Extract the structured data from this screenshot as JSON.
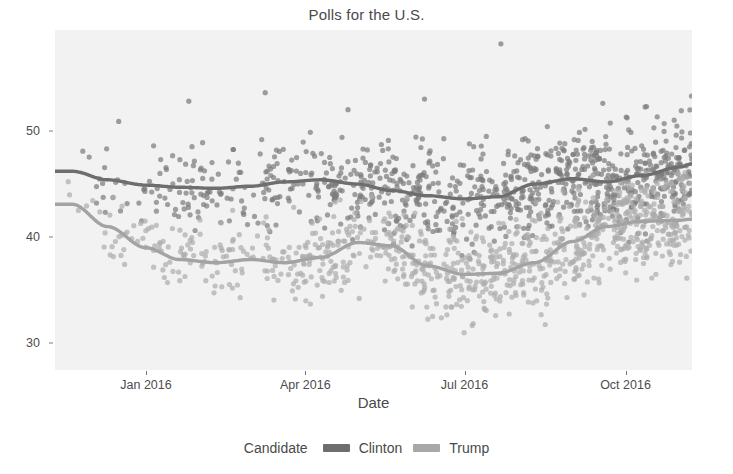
{
  "chart_data": {
    "type": "scatter",
    "title": "Polls for the U.S.",
    "xlabel": "Date",
    "ylabel": "",
    "grid": false,
    "legend_position": "bottom",
    "legend_title": "Candidate",
    "xlim": [
      "2015-11-10",
      "2016-11-08"
    ],
    "ylim": [
      27.5,
      59.5
    ],
    "yticks": [
      30,
      40,
      50
    ],
    "ytick_labels": [
      "30",
      "40",
      "50"
    ],
    "xticks": [
      "2016-01-01",
      "2016-04-01",
      "2016-07-01",
      "2016-10-01"
    ],
    "xtick_labels": [
      "Jan 2016",
      "Apr 2016",
      "Jul 2016",
      "Oct 2016"
    ],
    "colors": {
      "clinton_line": "#6e6e6e",
      "clinton_points": "#7d7d7d",
      "trump_line": "#a3a3a3",
      "trump_points": "#adadad",
      "panel_background": "#f2f2f2",
      "axis_text": "#4d4d4d"
    },
    "series": [
      {
        "name": "Clinton",
        "type": "smooth-trend",
        "trend_x": [
          "2015-11-20",
          "2015-12-10",
          "2016-01-01",
          "2016-01-20",
          "2016-02-10",
          "2016-03-01",
          "2016-03-20",
          "2016-04-10",
          "2016-05-01",
          "2016-05-20",
          "2016-06-10",
          "2016-07-01",
          "2016-07-20",
          "2016-08-10",
          "2016-09-01",
          "2016-09-20",
          "2016-10-10",
          "2016-11-01",
          "2016-11-08"
        ],
        "trend_y": [
          46.2,
          45.4,
          44.9,
          44.7,
          44.6,
          44.8,
          45.2,
          45.4,
          45.0,
          44.4,
          43.9,
          43.6,
          43.8,
          45.0,
          45.5,
          45.2,
          45.8,
          46.6,
          46.9
        ]
      },
      {
        "name": "Trump",
        "type": "smooth-trend",
        "trend_x": [
          "2015-11-20",
          "2015-12-10",
          "2016-01-01",
          "2016-01-20",
          "2016-02-10",
          "2016-03-01",
          "2016-03-20",
          "2016-04-10",
          "2016-05-01",
          "2016-05-20",
          "2016-06-10",
          "2016-07-01",
          "2016-07-20",
          "2016-08-10",
          "2016-09-01",
          "2016-09-20",
          "2016-10-10",
          "2016-11-01",
          "2016-11-08"
        ],
        "trend_y": [
          43.1,
          41.0,
          39.0,
          37.9,
          37.6,
          37.9,
          37.6,
          38.1,
          39.5,
          39.2,
          37.3,
          36.5,
          36.6,
          37.6,
          39.6,
          41.0,
          41.5,
          41.6,
          41.7
        ]
      }
    ]
  },
  "legend": {
    "title": "Candidate",
    "items": [
      {
        "label": "Clinton",
        "color": "#6e6e6e"
      },
      {
        "label": "Trump",
        "color": "#a8a8a8"
      }
    ]
  }
}
